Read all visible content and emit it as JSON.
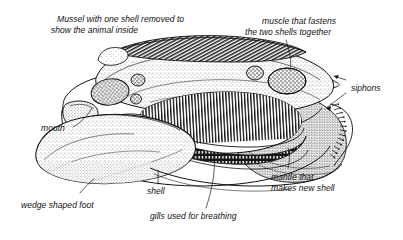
{
  "figure": {
    "style": "pen-and-ink line drawing with stipple shading",
    "background_color": "#ffffff",
    "ink_color": "#111111",
    "caption": {
      "line1": "Mussel with one shell removed to",
      "line2": "show the animal inside"
    },
    "labels": [
      {
        "id": "muscle",
        "line1": "muscle that fastens",
        "line2": "the two shells together",
        "anchor": "posterior-adductor-muscle"
      },
      {
        "id": "siphons",
        "line1": "siphons",
        "line2": "",
        "anchor": "siphon-openings"
      },
      {
        "id": "mouth",
        "line1": "mouth",
        "line2": "",
        "anchor": "mouth-opening"
      },
      {
        "id": "mantle",
        "line1": "mantle that",
        "line2": "makes new shell",
        "anchor": "mantle-edge"
      },
      {
        "id": "shell",
        "line1": "shell",
        "line2": "",
        "anchor": "shell-valve-rim"
      },
      {
        "id": "gills",
        "line1": "gills used for breathing",
        "line2": "",
        "anchor": "gill-filaments"
      },
      {
        "id": "foot",
        "line1": "wedge shaped foot",
        "line2": "",
        "anchor": "muscular-foot"
      }
    ],
    "parts": [
      "shell",
      "hinge",
      "anterior adductor muscle",
      "posterior adductor muscle",
      "mantle",
      "gills",
      "foot",
      "mouth",
      "siphons"
    ]
  }
}
